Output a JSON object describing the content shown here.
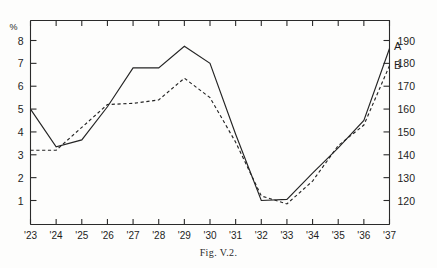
{
  "figure": {
    "caption": "Fig. V.2.",
    "left_axis_unit": "%",
    "series_label_a": "A",
    "series_label_b": "B"
  },
  "chart_data": {
    "type": "line",
    "title": "",
    "subtitle": "",
    "caption": "Fig. V.2.",
    "xlabel": "",
    "ylabel": "%",
    "y2label": "",
    "grid": false,
    "legend_position": "inline-right-end",
    "x": [
      "'23",
      "'24",
      "'25",
      "'26",
      "'27",
      "'28",
      "'29",
      "'30",
      "'31",
      "'32",
      "'33",
      "'34",
      "'35",
      "'36",
      "'37"
    ],
    "xlim": [
      "'23",
      "'37"
    ],
    "ylim": [
      0,
      8.5
    ],
    "yticks": [
      1,
      2,
      3,
      4,
      5,
      6,
      7,
      8
    ],
    "yticklabels": [
      "1",
      "2",
      "3",
      "4",
      "5",
      "6",
      "7",
      "8"
    ],
    "y2lim": [
      110,
      197
    ],
    "y2ticks": [
      120,
      130,
      140,
      150,
      160,
      170,
      180,
      190
    ],
    "y2ticklabels": [
      "120",
      "130",
      "140",
      "150",
      "160",
      "170",
      "180",
      "190"
    ],
    "series": [
      {
        "name": "A",
        "style": "solid",
        "axis": "left",
        "values": [
          5.0,
          3.35,
          3.65,
          5.1,
          6.8,
          6.8,
          7.75,
          7.0,
          3.9,
          1.0,
          1.05,
          2.2,
          3.3,
          4.5,
          7.65
        ]
      },
      {
        "name": "B",
        "style": "dashed",
        "axis": "left",
        "values": [
          3.2,
          3.2,
          4.2,
          5.2,
          5.25,
          5.4,
          6.35,
          5.5,
          3.55,
          1.2,
          0.85,
          1.85,
          3.4,
          4.3,
          6.9
        ]
      }
    ],
    "annotations": [
      {
        "text": "A",
        "x": "'37",
        "y": 7.75
      },
      {
        "text": "B",
        "x": "'37",
        "y": 6.95
      }
    ]
  }
}
